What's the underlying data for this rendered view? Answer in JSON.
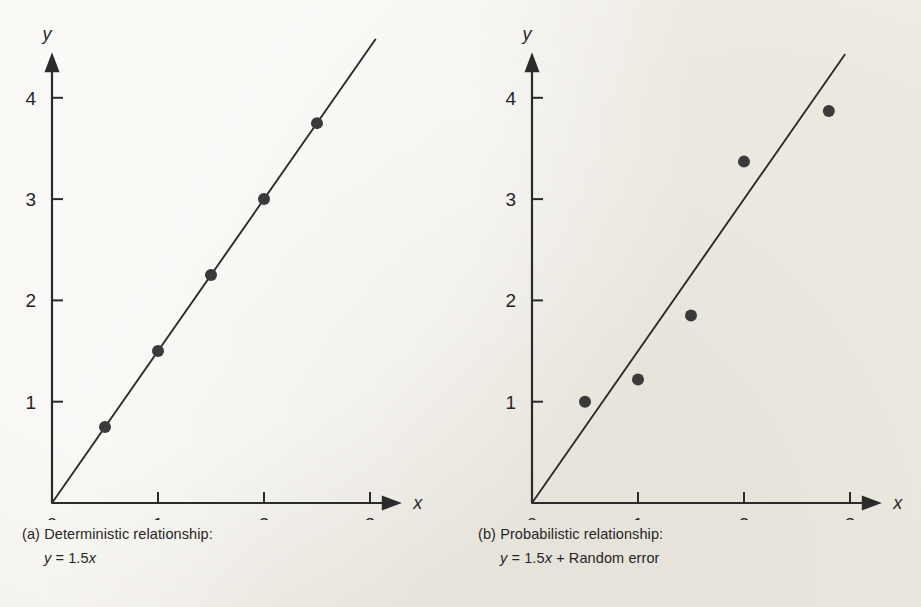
{
  "figure": {
    "background_color": "#f4f2ed",
    "ink_color": "#2b2b2b"
  },
  "panels": [
    {
      "id": "panel-a",
      "caption_line1": "(a) Deterministic relationship:",
      "caption_eq_lhs": "y",
      "caption_eq_rel": " = 1.5",
      "caption_eq_var": "x",
      "caption_eq_tail": "",
      "x_axis_label": "x",
      "y_axis_label": "y"
    },
    {
      "id": "panel-b",
      "caption_line1": "(b) Probabilistic relationship:",
      "caption_eq_lhs": "y",
      "caption_eq_rel": " = 1.5",
      "caption_eq_var": "x",
      "caption_eq_tail": " + Random error",
      "x_axis_label": "x",
      "y_axis_label": "y"
    }
  ],
  "chart_data": [
    {
      "type": "scatter",
      "id": "panel-a",
      "title": "(a) Deterministic relationship: y = 1.5x",
      "xlabel": "x",
      "ylabel": "y",
      "xlim": [
        0,
        3.3
      ],
      "ylim": [
        0,
        4.45
      ],
      "xticks": [
        0,
        1,
        2,
        3
      ],
      "xticklabels": [
        "0",
        "1",
        "2",
        "3"
      ],
      "yticks": [
        1,
        2,
        3,
        4
      ],
      "yticklabels": [
        "1",
        "2",
        "3",
        "4"
      ],
      "grid": false,
      "legend": false,
      "line": {
        "equation": "y = 1.5x",
        "slope": 1.5,
        "intercept": 0,
        "x_start": 0,
        "x_end": 3.05
      },
      "points": [
        {
          "x": 0.5,
          "y": 0.75
        },
        {
          "x": 1.0,
          "y": 1.5
        },
        {
          "x": 1.5,
          "y": 2.25
        },
        {
          "x": 2.0,
          "y": 3.0
        },
        {
          "x": 2.5,
          "y": 3.75
        }
      ]
    },
    {
      "type": "scatter",
      "id": "panel-b",
      "title": "(b) Probabilistic relationship: y = 1.5x + Random error",
      "xlabel": "x",
      "ylabel": "y",
      "xlim": [
        0,
        3.3
      ],
      "ylim": [
        0,
        4.45
      ],
      "xticks": [
        0,
        1,
        2,
        3
      ],
      "xticklabels": [
        "0",
        "1",
        "2",
        "3"
      ],
      "yticks": [
        1,
        2,
        3,
        4
      ],
      "yticklabels": [
        "1",
        "2",
        "3",
        "4"
      ],
      "grid": false,
      "legend": false,
      "line": {
        "equation": "y = 1.5x",
        "slope": 1.5,
        "intercept": 0,
        "x_start": 0,
        "x_end": 2.95
      },
      "points": [
        {
          "x": 0.5,
          "y": 1.0
        },
        {
          "x": 1.0,
          "y": 1.22
        },
        {
          "x": 1.5,
          "y": 1.85
        },
        {
          "x": 2.0,
          "y": 3.37
        },
        {
          "x": 2.8,
          "y": 3.87
        }
      ]
    }
  ]
}
